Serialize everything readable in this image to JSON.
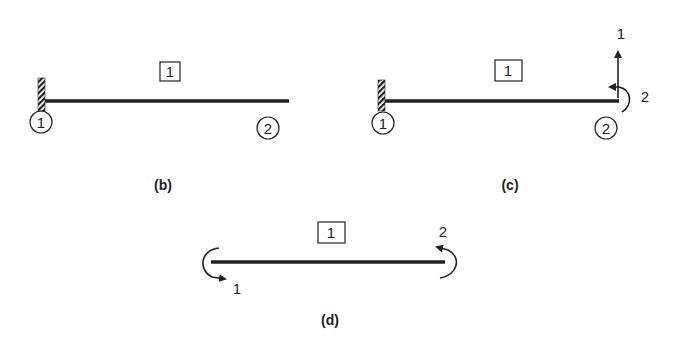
{
  "colors": {
    "ink": "#222222",
    "background": "#ffffff"
  },
  "panels": {
    "b": {
      "caption": "(b)",
      "element_label": "1",
      "nodes": [
        "1",
        "2"
      ],
      "support": "fixed-wall-at-node-1"
    },
    "c": {
      "caption": "(c)",
      "element_label": "1",
      "nodes": [
        "1",
        "2"
      ],
      "support": "fixed-wall-at-node-1",
      "dofs": [
        {
          "label": "1",
          "type": "vertical-translation-arrow"
        },
        {
          "label": "2",
          "type": "rotation-arrow"
        }
      ]
    },
    "d": {
      "caption": "(d)",
      "element_label": "1",
      "dofs": [
        {
          "label": "1",
          "type": "rotation-arrow-left-end"
        },
        {
          "label": "2",
          "type": "rotation-arrow-right-end"
        }
      ]
    }
  }
}
